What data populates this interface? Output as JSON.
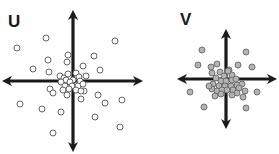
{
  "panels": [
    {
      "label": "U",
      "description": "widely dispersed scatter",
      "dot_fill": "#ffffff",
      "dot_stroke": "#555555",
      "axis_color": "#1a1a1a",
      "center": [
        73,
        81
      ],
      "axis_extent": {
        "left": 7,
        "right": 138,
        "top": 15,
        "bottom": 147
      },
      "dots": [
        [
          17,
          48
        ],
        [
          46,
          38
        ],
        [
          115,
          41
        ],
        [
          33,
          69
        ],
        [
          48,
          60
        ],
        [
          68,
          55
        ],
        [
          67,
          62
        ],
        [
          94,
          56
        ],
        [
          49,
          72
        ],
        [
          83,
          66
        ],
        [
          100,
          70
        ],
        [
          60,
          76
        ],
        [
          64,
          78
        ],
        [
          68,
          74
        ],
        [
          76,
          73
        ],
        [
          86,
          76
        ],
        [
          79,
          77
        ],
        [
          73,
          80
        ],
        [
          66,
          80
        ],
        [
          70,
          82
        ],
        [
          80,
          81
        ],
        [
          61,
          82
        ],
        [
          65,
          86
        ],
        [
          72,
          86
        ],
        [
          78,
          86
        ],
        [
          83,
          84
        ],
        [
          69,
          89
        ],
        [
          76,
          90
        ],
        [
          63,
          90
        ],
        [
          84,
          91
        ],
        [
          50,
          89
        ],
        [
          53,
          93
        ],
        [
          67,
          95
        ],
        [
          81,
          91
        ],
        [
          98,
          95
        ],
        [
          20,
          104
        ],
        [
          42,
          109
        ],
        [
          61,
          112
        ],
        [
          81,
          99
        ],
        [
          105,
          103
        ],
        [
          122,
          100
        ],
        [
          95,
          117
        ],
        [
          120,
          127
        ],
        [
          53,
          133
        ]
      ]
    },
    {
      "label": "V",
      "description": "tightly clustered scatter",
      "dot_fill": "#b3b3b3",
      "dot_stroke": "#666666",
      "axis_color": "#1a1a1a",
      "center": [
        226,
        79
      ],
      "axis_extent": {
        "left": 182,
        "right": 272,
        "top": 34,
        "bottom": 124
      },
      "dots": [
        [
          202,
          50
        ],
        [
          246,
          52
        ],
        [
          198,
          65
        ],
        [
          211,
          67
        ],
        [
          217,
          64
        ],
        [
          238,
          65
        ],
        [
          252,
          67
        ],
        [
          212,
          73
        ],
        [
          220,
          72
        ],
        [
          229,
          70
        ],
        [
          232,
          75
        ],
        [
          224,
          76
        ],
        [
          216,
          78
        ],
        [
          221,
          81
        ],
        [
          226,
          81
        ],
        [
          232,
          80
        ],
        [
          213,
          84
        ],
        [
          219,
          86
        ],
        [
          225,
          86
        ],
        [
          231,
          86
        ],
        [
          237,
          85
        ],
        [
          242,
          84
        ],
        [
          212,
          89
        ],
        [
          217,
          91
        ],
        [
          222,
          90
        ],
        [
          227,
          90
        ],
        [
          233,
          90
        ],
        [
          239,
          88
        ],
        [
          215,
          96
        ],
        [
          221,
          94
        ],
        [
          237,
          93
        ],
        [
          245,
          91
        ],
        [
          232,
          95
        ],
        [
          190,
          92
        ],
        [
          257,
          92
        ],
        [
          243,
          97
        ],
        [
          204,
          107
        ],
        [
          246,
          108
        ],
        [
          209,
          86
        ],
        [
          228,
          71
        ],
        [
          236,
          79
        ]
      ]
    }
  ]
}
